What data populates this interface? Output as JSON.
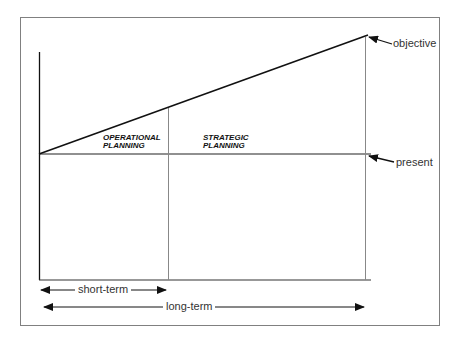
{
  "diagram": {
    "regions": {
      "operational": {
        "line1": "OPERATIONAL",
        "line2": "PLANNING"
      },
      "strategic": {
        "line1": "STRATEGIC",
        "line2": "PLANNING"
      }
    },
    "markers": {
      "objective": "objective",
      "present": "present"
    },
    "spans": {
      "short_term": "short-term",
      "long_term": "long-term"
    },
    "colors": {
      "line": "#111111",
      "frame": "#777777",
      "divider": "#888888",
      "background": "#ffffff"
    }
  }
}
